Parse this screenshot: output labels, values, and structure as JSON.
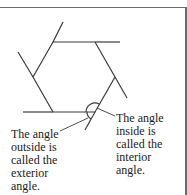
{
  "diagram": {
    "type": "hexagon-angles",
    "colors": {
      "line": "#3a3a3a",
      "frame": "#6a6a6a",
      "text": "#1a1a1a"
    },
    "labels": {
      "exterior": {
        "line1": "The angle",
        "line2": "outside is",
        "line3": "called the",
        "line4": "exterior",
        "line5": "angle."
      },
      "interior": {
        "line1": "The angle",
        "line2": "inside is",
        "line3": "called the",
        "line4": "interior",
        "line5": "angle."
      }
    }
  }
}
